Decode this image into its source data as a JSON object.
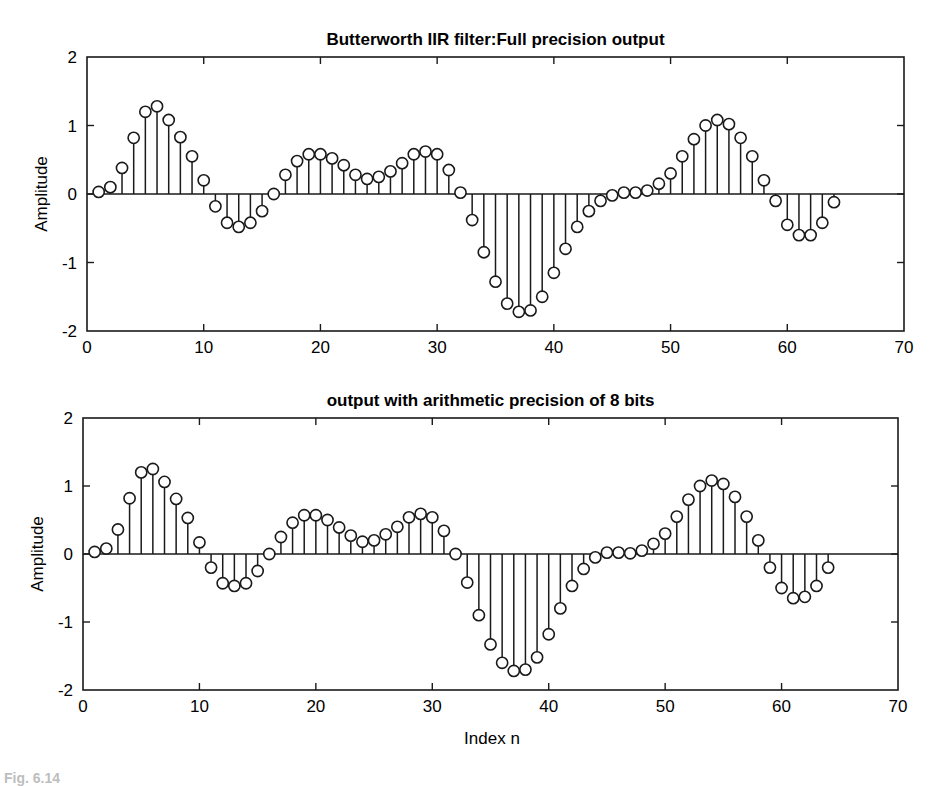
{
  "figure": {
    "xlabel": "Index n",
    "caption": "Fig. 6.14"
  },
  "chart_data": [
    {
      "type": "stem",
      "title": "Butterworth IIR filter:Full precision output",
      "xlabel": "",
      "ylabel": "Amplitude",
      "xlim": [
        0,
        70
      ],
      "ylim": [
        -2,
        2
      ],
      "xticks": [
        0,
        10,
        20,
        30,
        40,
        50,
        60,
        70
      ],
      "yticks": [
        2,
        1,
        0,
        -1,
        -2
      ],
      "grid": false,
      "marker": "open circle",
      "frame": {
        "left": 87,
        "right": 904,
        "top": 57,
        "bottom": 331
      },
      "x": [
        1,
        2,
        3,
        4,
        5,
        6,
        7,
        8,
        9,
        10,
        11,
        12,
        13,
        14,
        15,
        16,
        17,
        18,
        19,
        20,
        21,
        22,
        23,
        24,
        25,
        26,
        27,
        28,
        29,
        30,
        31,
        32,
        33,
        34,
        35,
        36,
        37,
        38,
        39,
        40,
        41,
        42,
        43,
        44,
        45,
        46,
        47,
        48,
        49,
        50,
        51,
        52,
        53,
        54,
        55,
        56,
        57,
        58,
        59,
        60,
        61,
        62,
        63,
        64
      ],
      "values": [
        0.03,
        0.1,
        0.38,
        0.82,
        1.2,
        1.28,
        1.08,
        0.83,
        0.55,
        0.2,
        -0.18,
        -0.42,
        -0.48,
        -0.42,
        -0.25,
        0.0,
        0.28,
        0.48,
        0.58,
        0.58,
        0.52,
        0.42,
        0.28,
        0.22,
        0.25,
        0.33,
        0.45,
        0.58,
        0.62,
        0.58,
        0.35,
        0.02,
        -0.38,
        -0.85,
        -1.28,
        -1.6,
        -1.72,
        -1.7,
        -1.5,
        -1.15,
        -0.8,
        -0.48,
        -0.25,
        -0.1,
        -0.02,
        0.02,
        0.02,
        0.05,
        0.15,
        0.3,
        0.55,
        0.8,
        1.0,
        1.08,
        1.02,
        0.82,
        0.55,
        0.2,
        -0.1,
        -0.45,
        -0.6,
        -0.6,
        -0.42,
        -0.12
      ]
    },
    {
      "type": "stem",
      "title": "output with arithmetic precision of 8 bits",
      "xlabel": "Index n",
      "ylabel": "Amplitude",
      "xlim": [
        0,
        70
      ],
      "ylim": [
        -2,
        2
      ],
      "xticks": [
        0,
        10,
        20,
        30,
        40,
        50,
        60,
        70
      ],
      "yticks": [
        2,
        1,
        0,
        -1,
        -2
      ],
      "grid": false,
      "marker": "open circle",
      "frame": {
        "left": 83,
        "right": 898,
        "top": 418,
        "bottom": 690
      },
      "x": [
        1,
        2,
        3,
        4,
        5,
        6,
        7,
        8,
        9,
        10,
        11,
        12,
        13,
        14,
        15,
        16,
        17,
        18,
        19,
        20,
        21,
        22,
        23,
        24,
        25,
        26,
        27,
        28,
        29,
        30,
        31,
        32,
        33,
        34,
        35,
        36,
        37,
        38,
        39,
        40,
        41,
        42,
        43,
        44,
        45,
        46,
        47,
        48,
        49,
        50,
        51,
        52,
        53,
        54,
        55,
        56,
        57,
        58,
        59,
        60,
        61,
        62,
        63,
        64
      ],
      "values": [
        0.03,
        0.08,
        0.36,
        0.82,
        1.2,
        1.25,
        1.06,
        0.81,
        0.53,
        0.17,
        -0.2,
        -0.43,
        -0.47,
        -0.43,
        -0.25,
        0.0,
        0.25,
        0.46,
        0.57,
        0.57,
        0.5,
        0.39,
        0.27,
        0.18,
        0.2,
        0.29,
        0.4,
        0.54,
        0.59,
        0.54,
        0.34,
        0.0,
        -0.42,
        -0.9,
        -1.33,
        -1.6,
        -1.72,
        -1.7,
        -1.52,
        -1.18,
        -0.8,
        -0.47,
        -0.22,
        -0.05,
        0.02,
        0.02,
        0.01,
        0.05,
        0.15,
        0.3,
        0.55,
        0.8,
        1.0,
        1.08,
        1.03,
        0.84,
        0.55,
        0.2,
        -0.2,
        -0.5,
        -0.65,
        -0.63,
        -0.47,
        -0.2
      ]
    }
  ]
}
